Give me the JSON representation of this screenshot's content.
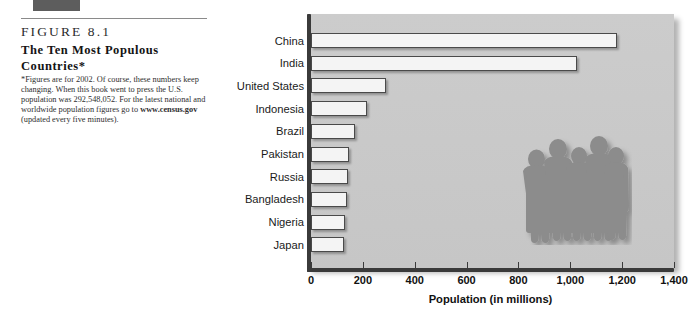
{
  "figure": {
    "number": "FIGURE  8.1",
    "title": "The Ten Most Populous Countries*",
    "note_line1": "*Figures are for 2002. Of course, these numbers keep changing. When this book went to press the U.S. population was 292,548,052. For the latest national and worldwide population figures go to ",
    "note_link": "www.census.gov",
    "note_line2": " (updated every five minutes)."
  },
  "graphic": {
    "people_silhouette": "group-of-people-silhouette",
    "people_count": 5,
    "fill_color": "#8a8a8a",
    "panel_color": "#c9c9c9"
  },
  "chart_data": {
    "type": "bar",
    "orientation": "horizontal",
    "title": "The Ten Most Populous Countries*",
    "xlabel": "Population (in millions)",
    "ylabel": "",
    "xlim": [
      0,
      1400
    ],
    "xticks": [
      0,
      200,
      400,
      600,
      800,
      1000,
      1200,
      1400
    ],
    "xtick_labels": [
      "0",
      "200",
      "400",
      "600",
      "800",
      "1,000",
      "1,200",
      "1,400"
    ],
    "grid": false,
    "legend": "none",
    "categories": [
      "China",
      "India",
      "United States",
      "Indonesia",
      "Brazil",
      "Pakistan",
      "Russia",
      "Bangladesh",
      "Nigeria",
      "Japan"
    ],
    "values": [
      1180,
      1025,
      290,
      217,
      170,
      145,
      144,
      140,
      130,
      127
    ],
    "units": "millions"
  }
}
